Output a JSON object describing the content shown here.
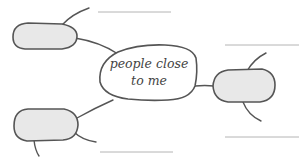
{
  "diagram": {
    "type": "mind-map",
    "center": {
      "line1": "people close",
      "line2": "to me"
    },
    "nodes": [
      {
        "id": "top-left",
        "label": ""
      },
      {
        "id": "right",
        "label": ""
      },
      {
        "id": "bottom-left",
        "label": ""
      }
    ],
    "writing_lines": 4,
    "colors": {
      "stroke": "#555555",
      "bubble_fill": "#e8e8e8",
      "center_fill": "#ffffff",
      "writing_line": "#b4b4b4"
    }
  }
}
